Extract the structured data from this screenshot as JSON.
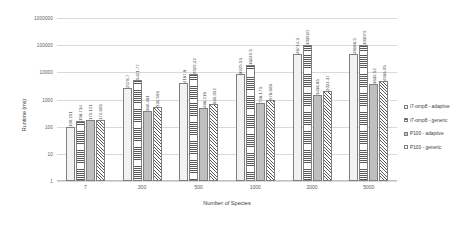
{
  "chart_data": {
    "type": "bar",
    "title": "",
    "xlabel": "Number of Species",
    "ylabel": "Runtime (ms)",
    "yscale": "log",
    "ylim": [
      1,
      1000000
    ],
    "yticks": [
      "1000000",
      "100000",
      "10000",
      "1000",
      "100",
      "10",
      "1"
    ],
    "grid": true,
    "legend_position": "right",
    "categories": [
      "7",
      "300",
      "500",
      "1000",
      "2000",
      "5000"
    ],
    "series": [
      {
        "name": "i7-omp8 - adaptive",
        "pattern": "dots",
        "values": [
          100.291,
          2578.7,
          4187.8,
          8925.53,
          48714.3,
          48186.5
        ],
        "labels": [
          "100.291",
          "2578.7",
          "4187.8",
          "8925.53",
          "48714.3",
          "48186.5"
        ]
      },
      {
        "name": "i7-omp8 - generic",
        "pattern": "horizontal-stripes",
        "values": [
          158.714,
          5421.77,
          9029.42,
          18249.5,
          103510,
          103079
        ],
        "labels": [
          "158.714",
          "5421.77",
          "9029.42",
          "18249.5",
          "103510",
          "103079"
        ]
      },
      {
        "name": "P100 - adaptive",
        "pattern": "solid-gray",
        "values": [
          179.121,
          369.481,
          486.218,
          758.173,
          1438.85,
          3639.52
        ],
        "labels": [
          "179.121",
          "369.481",
          "486.218",
          "758.173",
          "1438.85",
          "3639.52"
        ]
      },
      {
        "name": "P100 - generic",
        "pattern": "diagonal-hatch",
        "values": [
          174.605,
          531.566,
          669.092,
          978.608,
          2024.37,
          4966.05
        ],
        "labels": [
          "174.605",
          "531.566",
          "669.092",
          "978.608",
          "2024.37",
          "4966.05"
        ]
      }
    ]
  },
  "legend": {
    "items": [
      {
        "label": "i7-omp8 - adaptive"
      },
      {
        "label": "i7-omp8 - generic"
      },
      {
        "label": "P100 - adaptive"
      },
      {
        "label": "P100 - generic"
      }
    ]
  }
}
